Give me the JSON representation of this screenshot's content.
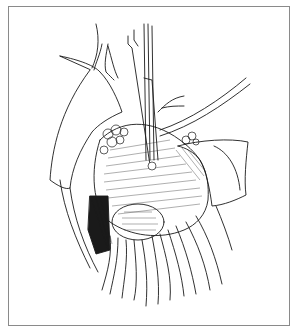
{
  "figure": {
    "kind": "surgical line-drawing illustration",
    "frame_color": "#8a8a8a",
    "ink_color": "#1a1a1a",
    "background": "#ffffff"
  }
}
